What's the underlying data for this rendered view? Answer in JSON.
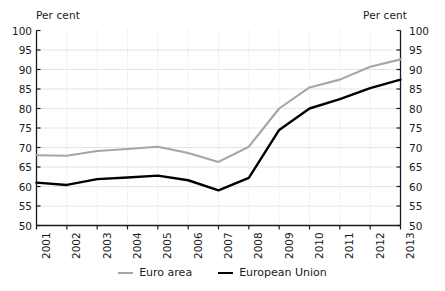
{
  "axis": {
    "unit_left": "Per cent",
    "unit_right": "Per cent",
    "y_ticks": [
      "100",
      "95",
      "90",
      "85",
      "80",
      "75",
      "70",
      "65",
      "60",
      "55",
      "50"
    ]
  },
  "legend": {
    "items": [
      {
        "label": "Euro area",
        "color": "#a6a6a6",
        "swatch": "line-swatch-gray"
      },
      {
        "label": "European Union",
        "color": "#000000",
        "swatch": "line-swatch-black"
      }
    ]
  },
  "chart_data": {
    "type": "line",
    "title": "",
    "xlabel": "",
    "ylabel": "Per cent",
    "ylim": [
      50,
      100
    ],
    "ytick_step": 5,
    "grid": true,
    "grid_horizontal": true,
    "grid_vertical_dotted": true,
    "legend_position": "bottom-center",
    "dual_y_axis": true,
    "categories": [
      "2001",
      "2002",
      "2003",
      "2004",
      "2005",
      "2006",
      "2007",
      "2008",
      "2009",
      "2010",
      "2011",
      "2012",
      "2013"
    ],
    "series": [
      {
        "name": "Euro area",
        "color": "#a6a6a6",
        "values": [
          68.0,
          67.9,
          69.1,
          69.6,
          70.2,
          68.6,
          66.3,
          70.2,
          80.0,
          85.4,
          87.4,
          90.7,
          92.6
        ]
      },
      {
        "name": "European Union",
        "color": "#000000",
        "values": [
          61.0,
          60.4,
          61.9,
          62.3,
          62.8,
          61.6,
          59.0,
          62.2,
          74.5,
          80.0,
          82.4,
          85.2,
          87.4
        ]
      }
    ]
  }
}
